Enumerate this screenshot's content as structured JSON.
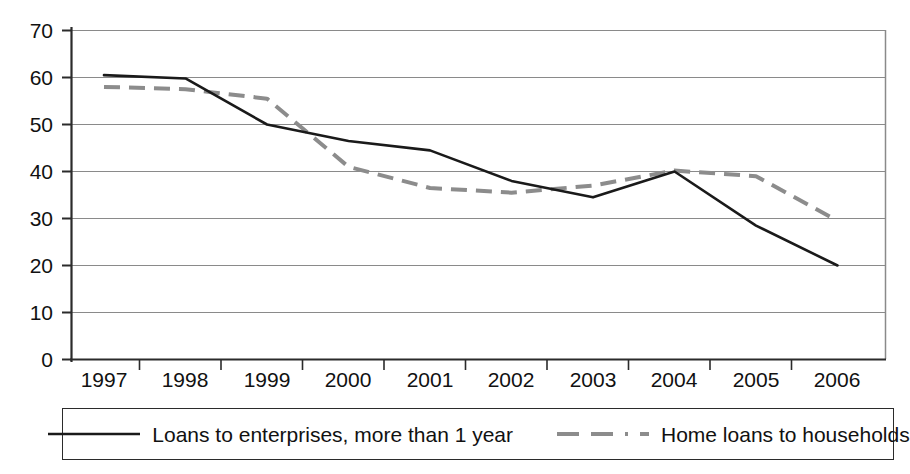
{
  "chart_data": {
    "type": "line",
    "title": "",
    "subtitle": "",
    "xlabel": "",
    "ylabel": "",
    "categories": [
      "1997",
      "1998",
      "1999",
      "2000",
      "2001",
      "2002",
      "2003",
      "2004",
      "2005",
      "2006"
    ],
    "x": [
      1997,
      1998,
      1999,
      2000,
      2001,
      2002,
      2003,
      2004,
      2005,
      2006
    ],
    "ylim": [
      0,
      70
    ],
    "y_ticks": [
      0,
      10,
      20,
      30,
      40,
      50,
      60,
      70
    ],
    "y_tick_labels": [
      "0",
      "10",
      "20",
      "30",
      "40",
      "50",
      "60",
      "70"
    ],
    "grid": true,
    "grid_axis": "y",
    "legend_position": "bottom",
    "series": [
      {
        "name": "Loans to enterprises, more than 1 year",
        "style": "solid",
        "color": "#1a1a1a",
        "values": [
          60.5,
          59.8,
          50.0,
          46.5,
          44.5,
          38.0,
          34.5,
          40.0,
          28.5,
          20.0
        ]
      },
      {
        "name": "Home loans to households",
        "style": "dashed",
        "color": "#8c8c8c",
        "values": [
          58.0,
          57.5,
          55.5,
          41.0,
          36.5,
          35.5,
          37.0,
          40.2,
          39.0,
          29.5
        ]
      }
    ]
  },
  "legend": {
    "entries": [
      {
        "label": "Loans to enterprises, more than 1 year"
      },
      {
        "label": "Home loans to households"
      }
    ]
  },
  "axes": {
    "y_labels": [
      "70",
      "60",
      "50",
      "40",
      "30",
      "20",
      "10",
      "0"
    ],
    "x_labels": [
      "1997",
      "1998",
      "1999",
      "2000",
      "2001",
      "2002",
      "2003",
      "2004",
      "2005",
      "2006"
    ]
  },
  "colors": {
    "series_solid": "#1a1a1a",
    "series_dashed": "#8c8c8c",
    "grid": "#8a8a8a",
    "axis": "#2b2b2b",
    "background": "#ffffff"
  }
}
